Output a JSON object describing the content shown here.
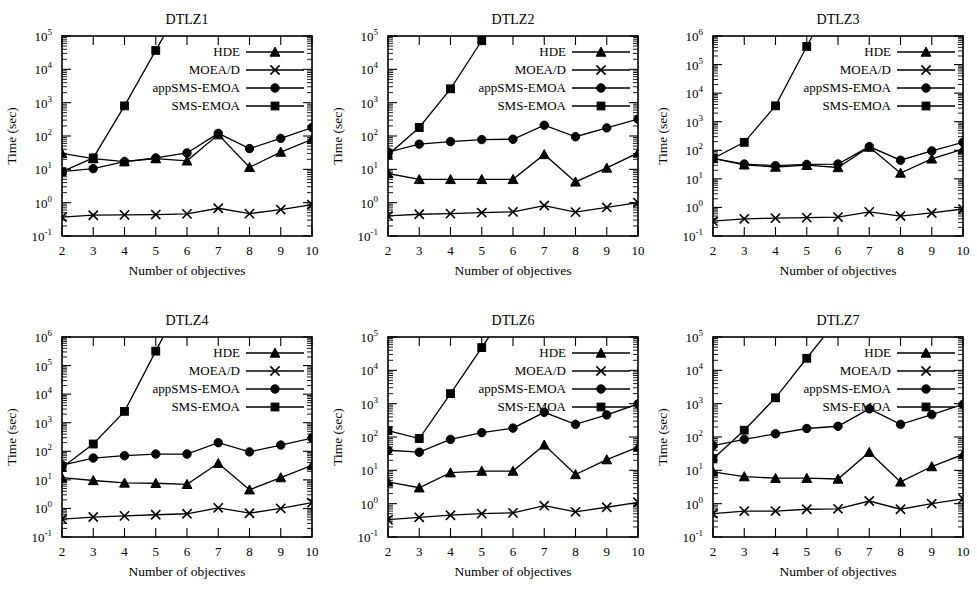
{
  "figure": {
    "name": "dtlz-runtime-comparison",
    "panel_order": [
      "DTLZ1",
      "DTLZ2",
      "DTLZ3",
      "DTLZ4",
      "DTLZ6",
      "DTLZ7"
    ]
  },
  "legend": {
    "position": "top-right",
    "entries": [
      {
        "label": "HDE",
        "marker": "triangle"
      },
      {
        "label": "MOEA/D",
        "marker": "x"
      },
      {
        "label": "appSMS-EMOA",
        "marker": "circle"
      },
      {
        "label": "SMS-EMOA",
        "marker": "square"
      }
    ]
  },
  "axes": {
    "xlabel": "Number of objectives",
    "ylabel": "Time (sec)",
    "x_ticks": [
      "2",
      "3",
      "4",
      "5",
      "6",
      "7",
      "8",
      "9",
      "10"
    ],
    "y_tick_base": "10"
  },
  "chart_data": [
    {
      "type": "line",
      "title": "DTLZ1",
      "xlabel": "Number of objectives",
      "ylabel": "Time (sec)",
      "xscale": "linear",
      "yscale": "log",
      "xlim": [
        2,
        10
      ],
      "ylim": [
        0.1,
        100000
      ],
      "y_tick_exponents": [
        -1,
        0,
        1,
        2,
        3,
        4,
        5
      ],
      "grid": false,
      "legend_position": "top-right",
      "x": [
        2,
        3,
        4,
        5,
        6,
        7,
        8,
        9,
        10
      ],
      "series": [
        {
          "name": "HDE",
          "marker": "triangle",
          "values": [
            30,
            21,
            17,
            21,
            18,
            110,
            11.5,
            33,
            80
          ]
        },
        {
          "name": "MOEA/D",
          "marker": "x",
          "values": [
            0.37,
            0.42,
            0.43,
            0.44,
            0.46,
            0.68,
            0.47,
            0.62,
            0.87
          ]
        },
        {
          "name": "appSMS-EMOA",
          "marker": "circle",
          "values": [
            8.5,
            10.5,
            17,
            22,
            31,
            120,
            42,
            85,
            180
          ]
        },
        {
          "name": "SMS-EMOA",
          "marker": "square",
          "values": [
            8.5,
            22,
            800,
            37000,
            null,
            null,
            null,
            null,
            null
          ]
        }
      ]
    },
    {
      "type": "line",
      "title": "DTLZ2",
      "xlabel": "Number of objectives",
      "ylabel": "Time (sec)",
      "xscale": "linear",
      "yscale": "log",
      "xlim": [
        2,
        10
      ],
      "ylim": [
        0.1,
        100000
      ],
      "y_tick_exponents": [
        -1,
        0,
        1,
        2,
        3,
        4,
        5
      ],
      "grid": false,
      "legend_position": "top-right",
      "x": [
        2,
        3,
        4,
        5,
        6,
        7,
        8,
        9,
        10
      ],
      "series": [
        {
          "name": "HDE",
          "marker": "triangle",
          "values": [
            7.5,
            5.0,
            5.0,
            5.0,
            5.0,
            28,
            4.2,
            11,
            31
          ]
        },
        {
          "name": "MOEA/D",
          "marker": "x",
          "values": [
            0.4,
            0.45,
            0.47,
            0.5,
            0.53,
            0.82,
            0.52,
            0.72,
            1.0
          ]
        },
        {
          "name": "appSMS-EMOA",
          "marker": "circle",
          "values": [
            33,
            57,
            68,
            78,
            80,
            210,
            95,
            175,
            320
          ]
        },
        {
          "name": "SMS-EMOA",
          "marker": "square",
          "values": [
            27,
            180,
            2600,
            72000,
            null,
            null,
            null,
            null,
            null
          ]
        }
      ]
    },
    {
      "type": "line",
      "title": "DTLZ3",
      "xlabel": "Number of objectives",
      "ylabel": "Time (sec)",
      "xscale": "linear",
      "yscale": "log",
      "xlim": [
        2,
        10
      ],
      "ylim": [
        0.1,
        1000000
      ],
      "y_tick_exponents": [
        -1,
        0,
        1,
        2,
        3,
        4,
        5,
        6
      ],
      "grid": false,
      "legend_position": "top-right",
      "x": [
        2,
        3,
        4,
        5,
        6,
        7,
        8,
        9,
        10
      ],
      "series": [
        {
          "name": "HDE",
          "marker": "triangle",
          "values": [
            52,
            31,
            26,
            30,
            25,
            130,
            16,
            50,
            110
          ]
        },
        {
          "name": "MOEA/D",
          "marker": "x",
          "values": [
            0.33,
            0.4,
            0.42,
            0.44,
            0.46,
            0.7,
            0.5,
            0.64,
            0.88
          ]
        },
        {
          "name": "appSMS-EMOA",
          "marker": "circle",
          "values": [
            52,
            33,
            29,
            32,
            33,
            135,
            45,
            95,
            190
          ]
        },
        {
          "name": "SMS-EMOA",
          "marker": "square",
          "values": [
            52,
            190,
            3600,
            430000,
            null,
            null,
            null,
            null,
            null
          ]
        }
      ]
    },
    {
      "type": "line",
      "title": "DTLZ4",
      "xlabel": "Number of objectives",
      "ylabel": "Time (sec)",
      "xscale": "linear",
      "yscale": "log",
      "xlim": [
        2,
        10
      ],
      "ylim": [
        0.1,
        1000000
      ],
      "y_tick_exponents": [
        -1,
        0,
        1,
        2,
        3,
        4,
        5,
        6
      ],
      "grid": false,
      "legend_position": "top-right",
      "x": [
        2,
        3,
        4,
        5,
        6,
        7,
        8,
        9,
        10
      ],
      "series": [
        {
          "name": "HDE",
          "marker": "triangle",
          "values": [
            12,
            9.5,
            7.8,
            7.6,
            7.0,
            38,
            4.5,
            12,
            32
          ]
        },
        {
          "name": "MOEA/D",
          "marker": "x",
          "values": [
            0.42,
            0.5,
            0.55,
            0.6,
            0.65,
            1.05,
            0.68,
            1.0,
            1.6
          ]
        },
        {
          "name": "appSMS-EMOA",
          "marker": "circle",
          "values": [
            33,
            58,
            70,
            80,
            80,
            200,
            95,
            165,
            290
          ]
        },
        {
          "name": "SMS-EMOA",
          "marker": "square",
          "values": [
            27,
            180,
            2500,
            320000,
            null,
            null,
            null,
            null,
            null
          ]
        }
      ]
    },
    {
      "type": "line",
      "title": "DTLZ6",
      "xlabel": "Number of objectives",
      "ylabel": "Time (sec)",
      "xscale": "linear",
      "yscale": "log",
      "xlim": [
        2,
        10
      ],
      "ylim": [
        0.1,
        100000
      ],
      "y_tick_exponents": [
        -1,
        0,
        1,
        2,
        3,
        4,
        5
      ],
      "grid": false,
      "legend_position": "top-right",
      "x": [
        2,
        3,
        4,
        5,
        6,
        7,
        8,
        9,
        10
      ],
      "series": [
        {
          "name": "HDE",
          "marker": "triangle",
          "values": [
            4.5,
            3.0,
            8.5,
            9.5,
            9.5,
            58,
            7.5,
            21,
            50
          ]
        },
        {
          "name": "MOEA/D",
          "marker": "x",
          "values": [
            0.33,
            0.39,
            0.45,
            0.5,
            0.53,
            0.87,
            0.57,
            0.78,
            1.1
          ]
        },
        {
          "name": "appSMS-EMOA",
          "marker": "circle",
          "values": [
            40,
            35,
            85,
            135,
            185,
            550,
            240,
            460,
            980
          ]
        },
        {
          "name": "SMS-EMOA",
          "marker": "square",
          "values": [
            155,
            90,
            2000,
            48000,
            null,
            null,
            null,
            null,
            null
          ]
        }
      ]
    },
    {
      "type": "line",
      "title": "DTLZ7",
      "xlabel": "Number of objectives",
      "ylabel": "Time (sec)",
      "xscale": "linear",
      "yscale": "log",
      "xlim": [
        2,
        10
      ],
      "ylim": [
        0.1,
        100000
      ],
      "y_tick_exponents": [
        -1,
        0,
        1,
        2,
        3,
        4,
        5
      ],
      "grid": false,
      "legend_position": "top-right",
      "x": [
        2,
        3,
        4,
        5,
        6,
        7,
        8,
        9,
        10
      ],
      "series": [
        {
          "name": "HDE",
          "marker": "triangle",
          "values": [
            9.0,
            6.5,
            5.8,
            5.8,
            5.5,
            35,
            4.5,
            13,
            30
          ]
        },
        {
          "name": "MOEA/D",
          "marker": "x",
          "values": [
            0.5,
            0.6,
            0.6,
            0.68,
            0.7,
            1.2,
            0.68,
            1.0,
            1.4
          ]
        },
        {
          "name": "appSMS-EMOA",
          "marker": "circle",
          "values": [
            55,
            85,
            125,
            180,
            210,
            700,
            240,
            470,
            950
          ]
        },
        {
          "name": "SMS-EMOA",
          "marker": "square",
          "values": [
            22,
            160,
            1500,
            23000,
            null,
            null,
            null,
            null,
            null
          ]
        }
      ]
    }
  ]
}
